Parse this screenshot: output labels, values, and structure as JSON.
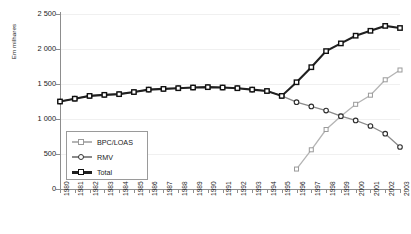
{
  "chart_data": {
    "type": "line",
    "title": "",
    "xlabel": "",
    "ylabel": "Em milhares",
    "ylim": [
      0,
      2500
    ],
    "yticks": [
      "0",
      "500",
      "1 000",
      "1 500",
      "2 000",
      "2 500"
    ],
    "ytick_values": [
      0,
      500,
      1000,
      1500,
      2000,
      2500
    ],
    "grid": true,
    "legend_position": "inside-lower-left",
    "categories": [
      "1980",
      "1981",
      "1982",
      "1983",
      "1984",
      "1985",
      "1986",
      "1987",
      "1988",
      "1989",
      "1990",
      "1991",
      "1992",
      "1993",
      "1994",
      "1995",
      "1996",
      "1997",
      "1998",
      "1999",
      "2000",
      "2001",
      "2002",
      "2003"
    ],
    "series": [
      {
        "name": "BPC/LOAS",
        "color": "#b4b4b4",
        "marker": "square",
        "values": [
          null,
          null,
          null,
          null,
          null,
          null,
          null,
          null,
          null,
          null,
          null,
          null,
          null,
          null,
          null,
          null,
          285,
          560,
          850,
          1040,
          1210,
          1340,
          1560,
          1700
        ]
      },
      {
        "name": "RMV",
        "color": "#8a8a8a",
        "marker": "circle",
        "values": [
          1250,
          1290,
          1330,
          1345,
          1355,
          1385,
          1420,
          1430,
          1440,
          1450,
          1455,
          1450,
          1440,
          1420,
          1400,
          1330,
          1240,
          1180,
          1120,
          1040,
          980,
          900,
          790,
          600
        ]
      },
      {
        "name": "Total",
        "color": "#202020",
        "marker": "square",
        "values": [
          1250,
          1290,
          1330,
          1345,
          1355,
          1385,
          1420,
          1430,
          1440,
          1450,
          1455,
          1450,
          1440,
          1420,
          1400,
          1330,
          1525,
          1740,
          1970,
          2080,
          2190,
          2260,
          2330,
          2300
        ]
      }
    ]
  },
  "legend": {
    "items": [
      {
        "label": "BPC/LOAS"
      },
      {
        "label": "RMV"
      },
      {
        "label": "Total"
      }
    ]
  }
}
